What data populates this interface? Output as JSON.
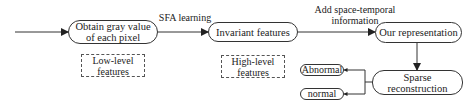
{
  "diagram": {
    "nodes": {
      "obtain": {
        "line1": "Obtain gray value",
        "line2": "of each pixel"
      },
      "invariant": {
        "label": "Invariant features"
      },
      "representation": {
        "label": "Our representation"
      },
      "sparse": {
        "label": "Sparse reconstruction"
      },
      "abnormal": {
        "label": "Abnormal"
      },
      "normal": {
        "label": "normal"
      }
    },
    "edges": {
      "sfa": {
        "label": "SFA learning"
      },
      "add_info": {
        "line1": "Add space-temporal",
        "line2": "information"
      }
    },
    "annotations": {
      "low": {
        "line1": "Low-level",
        "line2": "features"
      },
      "high": {
        "line1": "High-level",
        "line2": "features"
      }
    },
    "colors": {
      "stroke": "#333333",
      "background": "#ffffff"
    }
  }
}
